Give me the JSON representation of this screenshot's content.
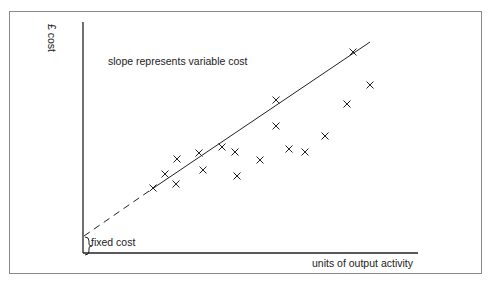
{
  "diagram": {
    "y_axis_label": "£ cost",
    "x_axis_label": "units of output activity",
    "annotation_slope": "slope represents variable cost",
    "annotation_intercept": "fixed cost"
  },
  "chart_data": {
    "type": "scatter",
    "title": "",
    "xlabel": "units of output activity",
    "ylabel": "£ cost",
    "grid": false,
    "legend": null,
    "annotations": [
      "slope represents variable cost",
      "fixed cost"
    ],
    "points_pixel": [
      [
        153,
        188
      ],
      [
        165,
        174
      ],
      [
        177,
        159
      ],
      [
        176,
        184
      ],
      [
        199,
        153
      ],
      [
        203,
        170
      ],
      [
        222,
        147
      ],
      [
        235,
        152
      ],
      [
        237,
        176
      ],
      [
        260,
        160
      ],
      [
        276,
        100
      ],
      [
        276,
        126
      ],
      [
        289,
        149
      ],
      [
        305,
        152
      ],
      [
        325,
        136
      ],
      [
        347,
        104
      ],
      [
        353,
        52
      ],
      [
        370,
        85
      ]
    ],
    "fit_line": {
      "intercept_pixel": [
        84,
        236
      ],
      "dash_until_pixel": [
        152,
        189
      ],
      "end_pixel": [
        370,
        42
      ]
    }
  }
}
